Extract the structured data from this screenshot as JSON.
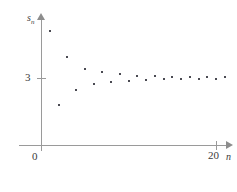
{
  "figure": {
    "background_color": "#ffffff",
    "axis_color": "#9a9a9a",
    "point_color": "#4a4a52"
  },
  "axes": {
    "origin_label": "0",
    "y_axis_title": "s",
    "y_axis_subscript": "n",
    "x_axis_title": "n",
    "y_tick_label": "3",
    "x_tick_label": "20"
  },
  "chart_data": {
    "type": "scatter",
    "title": "",
    "subtitle": "",
    "xlabel": "n",
    "ylabel": "s_n",
    "xlim": [
      0,
      21.3
    ],
    "ylim": [
      0,
      5.65
    ],
    "grid": false,
    "legend": null,
    "annotations": [],
    "x_ticks": [
      0,
      20
    ],
    "x_tick_labels": [
      "0",
      "20"
    ],
    "y_ticks": [
      3
    ],
    "y_tick_labels": [
      "3"
    ],
    "limit_value": 3,
    "x": [
      1,
      2,
      3,
      4,
      5,
      6,
      7,
      8,
      9,
      10,
      11,
      12,
      13,
      14,
      15,
      16,
      17,
      18,
      19,
      20,
      21
    ],
    "y": [
      5.07,
      1.81,
      3.93,
      2.47,
      3.4,
      2.74,
      3.26,
      2.82,
      3.16,
      2.87,
      3.11,
      2.91,
      3.08,
      2.94,
      3.06,
      2.95,
      3.05,
      2.96,
      3.04,
      2.97,
      3.03
    ],
    "series": [
      {
        "name": "s_n",
        "marker": "square",
        "values": [
          5.07,
          1.81,
          3.93,
          2.47,
          3.4,
          2.74,
          3.26,
          2.82,
          3.16,
          2.87,
          3.11,
          2.91,
          3.08,
          2.94,
          3.06,
          2.95,
          3.05,
          2.96,
          3.04,
          2.97,
          3.03
        ]
      }
    ]
  }
}
